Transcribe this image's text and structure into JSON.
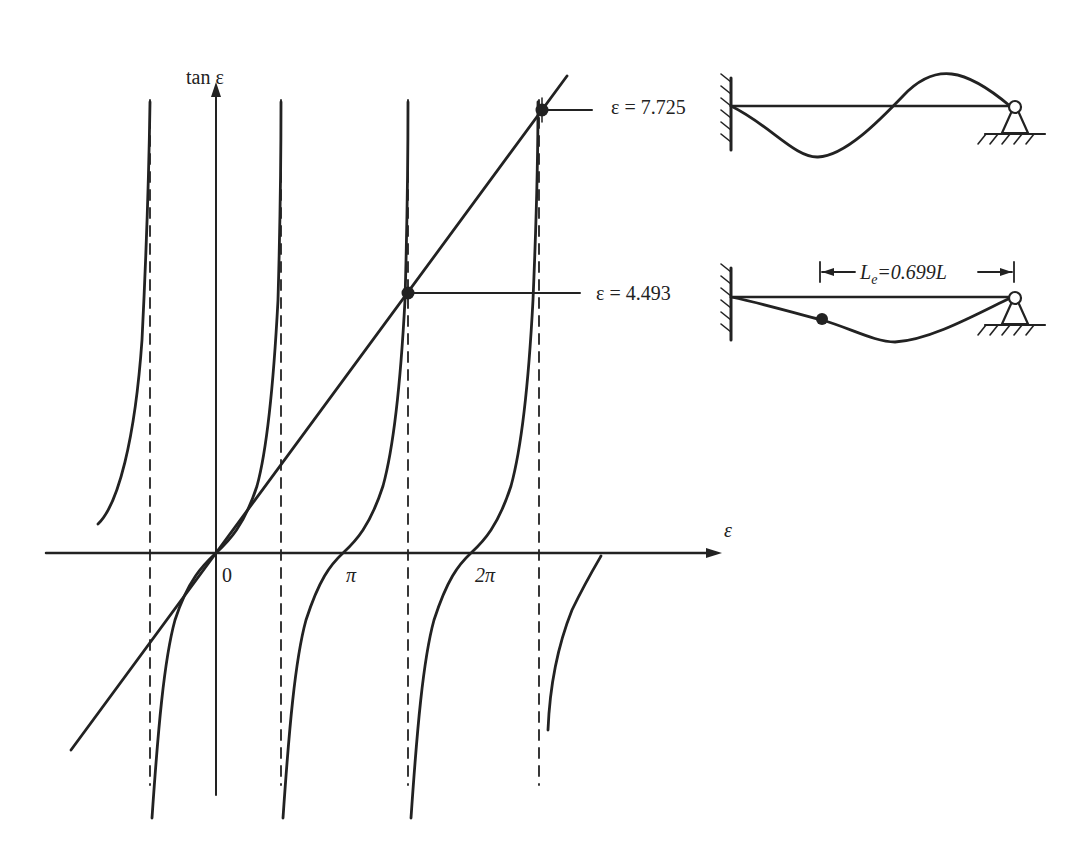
{
  "figure": {
    "y_axis_label": "tan ε",
    "x_axis_label": "ε",
    "origin_label": "0",
    "x_ticks": [
      {
        "label": "π",
        "value": 3.1416
      },
      {
        "label": "2π",
        "value": 6.2832
      }
    ],
    "roots": [
      {
        "label": "ε = 4.493",
        "value": 4.493
      },
      {
        "label": "ε = 7.725",
        "value": 7.725
      }
    ],
    "effective_length": {
      "symbol": "L",
      "subscript": "e",
      "text": "=0.699L"
    },
    "mode_shapes": [
      {
        "name": "second-mode",
        "description": "fixed-pinned beam, second buckling mode"
      },
      {
        "name": "first-mode",
        "description": "fixed-pinned beam, first buckling mode with inflection point"
      }
    ],
    "asymptotes": [
      "-π/2",
      "π/2",
      "3π/2",
      "5π/2"
    ],
    "ink_color": "#222222"
  }
}
